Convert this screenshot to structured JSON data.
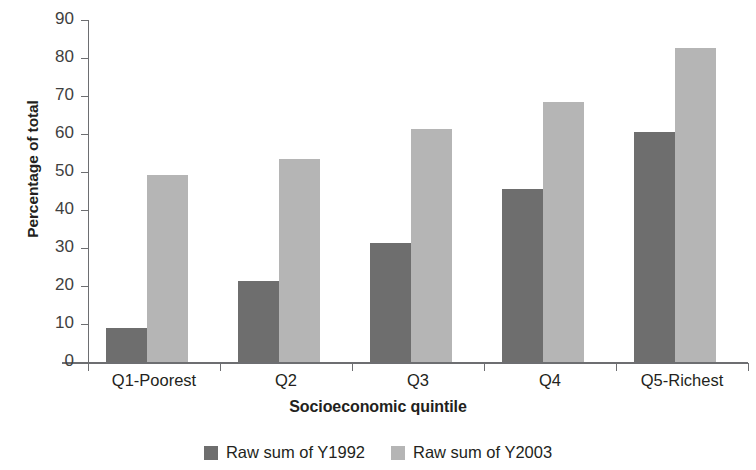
{
  "chart_data": {
    "type": "bar",
    "title": "",
    "subtitle": "",
    "xlabel": "Socioeconomic quintile",
    "ylabel": "Percentage of total",
    "categories": [
      "Q1-Poorest",
      "Q2",
      "Q3",
      "Q4",
      "Q5-Richest"
    ],
    "series": [
      {
        "name": "Raw sum of Y1992",
        "color": "#6e6e6e",
        "values": [
          9,
          21.3,
          31.4,
          45.5,
          60.6
        ]
      },
      {
        "name": "Raw sum of Y2003",
        "color": "#b5b5b5",
        "values": [
          49.1,
          53.4,
          61.3,
          68.5,
          82.6
        ]
      }
    ],
    "ylim": [
      0,
      90
    ],
    "y_ticks": [
      0,
      10,
      20,
      30,
      40,
      50,
      60,
      70,
      80,
      90
    ],
    "y_tick_labels": [
      "0",
      "10",
      "20",
      "30",
      "40",
      "50",
      "60",
      "70",
      "80",
      "90"
    ],
    "grid": false,
    "legend_position": "bottom"
  },
  "axes": {
    "y_title": "Percentage of total",
    "x_title": "Socioeconomic quintile"
  },
  "legend": {
    "items": [
      {
        "label": "Raw sum of Y1992",
        "swatch": "dark-gray-swatch"
      },
      {
        "label": "Raw sum of Y2003",
        "swatch": "light-gray-swatch"
      }
    ]
  }
}
